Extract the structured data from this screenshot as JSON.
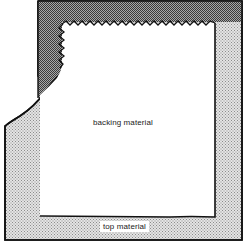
{
  "diagram": {
    "labels": {
      "backing": "backing material",
      "top": "top material"
    },
    "regions": [
      {
        "name": "top material",
        "shade": "light-dotted",
        "color": "#cfcfcf"
      },
      {
        "name": "folded-over corner",
        "shade": "dark-dotted",
        "color": "#8a8a8a"
      },
      {
        "name": "backing material",
        "shade": "white",
        "color": "#ffffff"
      }
    ],
    "colors": {
      "outline": "#111111",
      "light_fill": "#cfcfcf",
      "dark_fill": "#8a8a8a",
      "backing_fill": "#ffffff"
    }
  }
}
